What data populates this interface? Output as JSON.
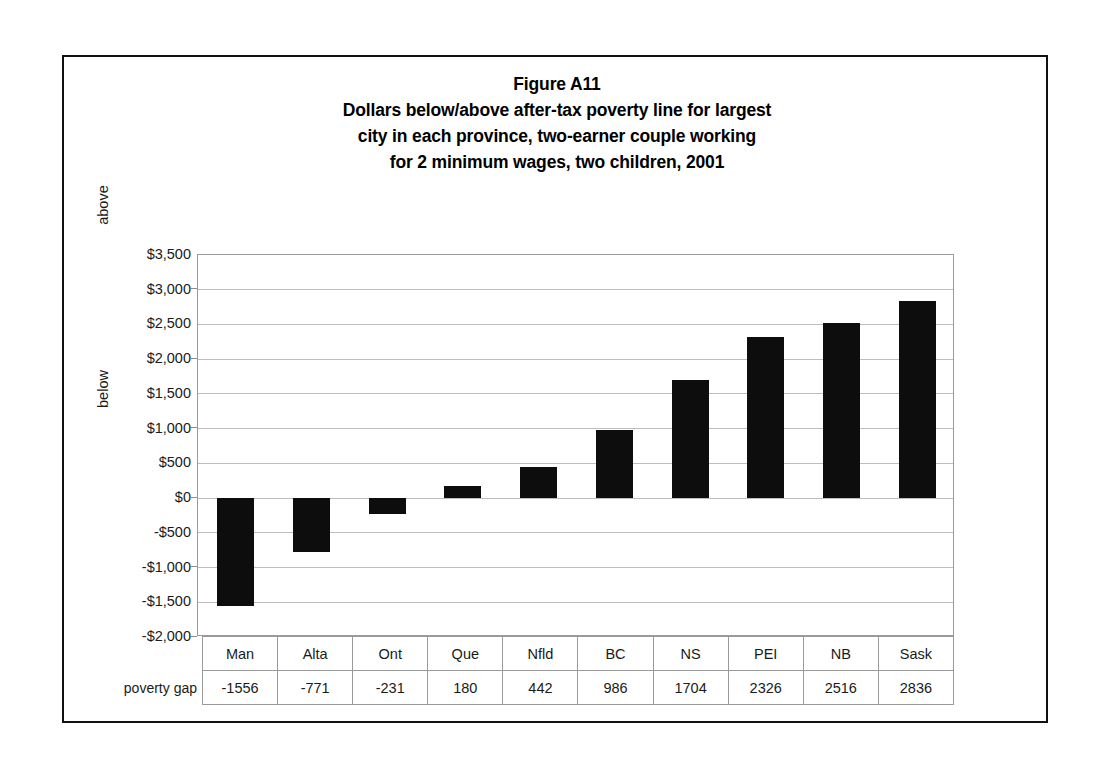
{
  "figure": {
    "title_lines": [
      "Figure A11",
      "Dollars below/above after-tax poverty line for largest",
      "city in each province, two-earner couple working",
      "for 2 minimum wages, two children, 2001"
    ],
    "axis_group_labels": {
      "above": "above",
      "below": "below"
    },
    "row_header": "poverty gap"
  },
  "chart_data": {
    "type": "bar",
    "categories": [
      "Man",
      "Alta",
      "Ont",
      "Que",
      "Nfld",
      "BC",
      "NS",
      "PEI",
      "NB",
      "Sask"
    ],
    "values": [
      -1556,
      -771,
      -231,
      180,
      442,
      986,
      1704,
      2326,
      2516,
      2836
    ],
    "series_name": "poverty gap",
    "xlabel": "",
    "ylabel": "",
    "ylim": [
      -2000,
      3500
    ],
    "ytick_values": [
      3500,
      3000,
      2500,
      2000,
      1500,
      1000,
      500,
      0,
      -500,
      -1000,
      -1500,
      -2000
    ],
    "ytick_labels": [
      "$3,500",
      "$3,000",
      "$2,500",
      "$2,000",
      "$1,500",
      "$1,000",
      "$500",
      "$0",
      "-$500",
      "-$1,000",
      "-$1,500",
      "-$2,000"
    ],
    "grid": true,
    "legend": "none",
    "bar_color": "#0d0d0d",
    "gridline_color": "#bdbdbd"
  }
}
